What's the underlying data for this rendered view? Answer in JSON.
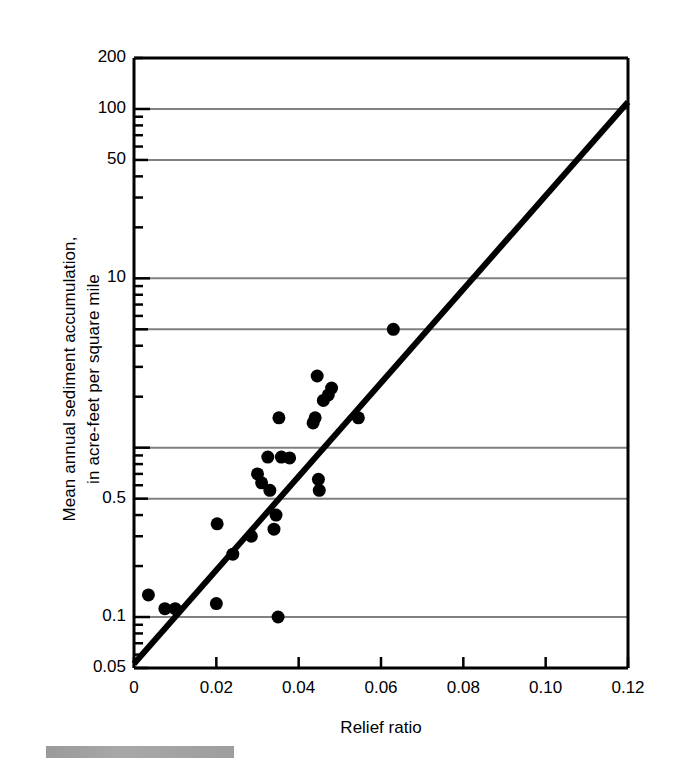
{
  "chart_data": {
    "type": "scatter",
    "title": "",
    "xlabel": "Relief ratio",
    "ylabel": "Mean annual sediment accumulation,\nin acre-feet per square mile",
    "xlim": [
      0,
      0.12
    ],
    "ylim": [
      0.05,
      200
    ],
    "yscale": "log",
    "xscale": "linear",
    "grid": "horizontal",
    "legend": "none",
    "xticks": [
      "0",
      "0.02",
      "0.04",
      "0.06",
      "0.08",
      "0.10",
      "0.12"
    ],
    "xtick_values": [
      0,
      0.02,
      0.04,
      0.06,
      0.08,
      0.1,
      0.12
    ],
    "yticks": [
      "200",
      "100",
      "50",
      "10",
      "0.5",
      "0.1",
      "0.05"
    ],
    "ytick_values": [
      200,
      100,
      50,
      10,
      0.5,
      0.1,
      0.05
    ],
    "gridline_values": [
      100,
      50,
      10,
      5,
      1,
      0.5,
      0.1
    ],
    "marker": "filled-circle",
    "marker_color": "#000000",
    "marker_size_px": 13,
    "points": [
      {
        "x": 0.0035,
        "y": 0.135
      },
      {
        "x": 0.0075,
        "y": 0.112
      },
      {
        "x": 0.01,
        "y": 0.112
      },
      {
        "x": 0.02,
        "y": 0.12
      },
      {
        "x": 0.0202,
        "y": 0.355
      },
      {
        "x": 0.024,
        "y": 0.235
      },
      {
        "x": 0.0285,
        "y": 0.3
      },
      {
        "x": 0.03,
        "y": 0.7
      },
      {
        "x": 0.031,
        "y": 0.62
      },
      {
        "x": 0.0325,
        "y": 0.88
      },
      {
        "x": 0.033,
        "y": 0.56
      },
      {
        "x": 0.034,
        "y": 0.33
      },
      {
        "x": 0.0345,
        "y": 0.4
      },
      {
        "x": 0.035,
        "y": 0.1
      },
      {
        "x": 0.0352,
        "y": 1.5
      },
      {
        "x": 0.0358,
        "y": 0.88
      },
      {
        "x": 0.0378,
        "y": 0.87
      },
      {
        "x": 0.0435,
        "y": 1.4
      },
      {
        "x": 0.044,
        "y": 1.5
      },
      {
        "x": 0.0445,
        "y": 2.65
      },
      {
        "x": 0.0448,
        "y": 0.65
      },
      {
        "x": 0.045,
        "y": 0.56
      },
      {
        "x": 0.046,
        "y": 1.9
      },
      {
        "x": 0.0472,
        "y": 2.05
      },
      {
        "x": 0.048,
        "y": 2.25
      },
      {
        "x": 0.0545,
        "y": 1.5
      },
      {
        "x": 0.063,
        "y": 5.0
      }
    ],
    "trendline": {
      "type": "line",
      "x0": 0.0,
      "y0": 0.053,
      "x1": 0.12,
      "y1": 110,
      "color": "#000000",
      "width_px": 6
    }
  },
  "axes": {
    "frame_color": "#000000",
    "grid_color": "#808080",
    "background": "#ffffff"
  },
  "footer": {
    "bar_label": "gray-scale-bar"
  }
}
